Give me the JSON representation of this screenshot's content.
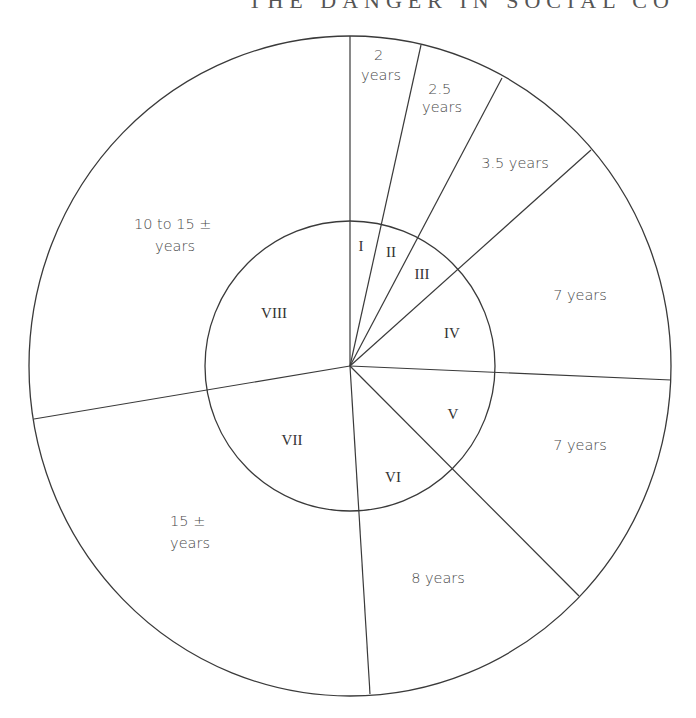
{
  "header": {
    "partial_text": "THE DANGER IN SOCIAL CO"
  },
  "diagram": {
    "type": "concentric-sector-diagram",
    "center": [
      350,
      366
    ],
    "outer_radius": [
      321,
      330
    ],
    "inner_radius": 145,
    "sectors": [
      {
        "id": "I",
        "inner_label": "I",
        "outer_label_lines": [
          "2",
          "years"
        ]
      },
      {
        "id": "II",
        "inner_label": "II",
        "outer_label_lines": [
          "2.5",
          "years"
        ]
      },
      {
        "id": "III",
        "inner_label": "III",
        "outer_label_lines": [
          "3.5 years"
        ]
      },
      {
        "id": "IV",
        "inner_label": "IV",
        "outer_label_lines": [
          "7 years"
        ]
      },
      {
        "id": "V",
        "inner_label": "V",
        "outer_label_lines": [
          "7 years"
        ]
      },
      {
        "id": "VI",
        "inner_label": "VI",
        "outer_label_lines": [
          "8 years"
        ]
      },
      {
        "id": "VII",
        "inner_label": "VII",
        "outer_label_lines": [
          "15 ±",
          "years"
        ]
      },
      {
        "id": "VIII",
        "inner_label": "VIII",
        "outer_label_lines": [
          "10 to 15 ±",
          "years"
        ]
      }
    ],
    "divider_endpoints": [
      [
        350,
        36
      ],
      [
        421,
        45
      ],
      [
        502,
        78
      ],
      [
        591,
        150
      ],
      [
        671,
        380
      ],
      [
        579,
        596
      ],
      [
        370,
        694
      ],
      [
        34,
        419
      ]
    ],
    "line_color": "#3a3a3a",
    "text_color": "#4a4a4a"
  }
}
